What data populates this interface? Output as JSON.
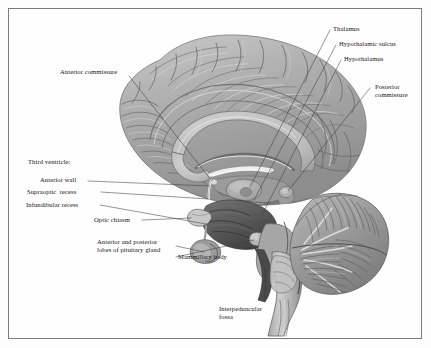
{
  "figure": {
    "frame_color": "#7a7a7a",
    "background_color": "#fefefe",
    "ink_color": "#141414",
    "leader_color": "#4a4a4a"
  },
  "labels": {
    "anterior_commissure": "Anterior commissure",
    "third_ventricle_heading": "Third ventricle:",
    "anterior_wall": "Anterior wall",
    "supraoptic_recess": "Supraoptic  recess",
    "infundibular_recess": "Infundibular recess",
    "optic_chiasm": "Optic chiasm",
    "pituitary_line1": "Anterior and posterior",
    "pituitary_line2": "lobes of pituitary gland",
    "mammillary_body": "Mammillary body",
    "thalamus": "Thalamus",
    "hypothalamic_sulcus": "Hypothalamic sulcus",
    "hypothalamus": "Hypothalamus",
    "posterior_commissure_line1": "Posterior",
    "posterior_commissure_line2": "commissure",
    "interpeduncular_line1": "Interpeduncular",
    "interpeduncular_line2": "fossa"
  },
  "illustration": {
    "subject": "human brain midsagittal section",
    "style": "grayscale engraving / halftone anatomical plate",
    "parts": [
      "cerebral hemisphere medial surface with gyri and sulci",
      "corpus callosum",
      "fornix",
      "thalamus",
      "hypothalamus",
      "third ventricle",
      "optic chiasm",
      "pituitary gland",
      "mammillary body",
      "midbrain and interpeduncular fossa",
      "pons",
      "cerebellum with arbor vitae",
      "medulla oblongata and spinal cord"
    ]
  }
}
